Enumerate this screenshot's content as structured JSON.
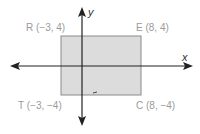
{
  "diagram": {
    "type": "coordinate-plane-rectangle",
    "axes": {
      "x_label": "x",
      "y_label": "y"
    },
    "points": [
      {
        "name": "R",
        "label": "R (−3, 4)",
        "x": -3,
        "y": 4
      },
      {
        "name": "E",
        "label": "E (8, 4)",
        "x": 8,
        "y": 4
      },
      {
        "name": "T",
        "label": "T (−3, −4)",
        "x": -3,
        "y": -4
      },
      {
        "name": "C",
        "label": "C (8, −4)",
        "x": 8,
        "y": -4
      }
    ],
    "colors": {
      "fill": "#dcdcdc",
      "stroke": "#8a8a8a",
      "axis": "#222222",
      "label": "#9a9a9a"
    }
  }
}
